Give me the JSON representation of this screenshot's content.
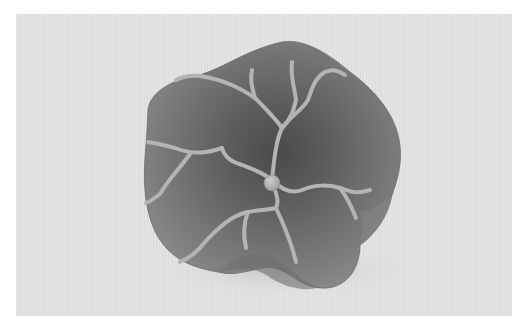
{
  "image": {
    "subject": "clay flower with raised veins",
    "alt": "Grayscale photograph of a sculpted clay flower with raised vein lines and a round center bead on a light textured background",
    "colors": {
      "border": "#ffffff",
      "background": "#e4e4e4",
      "petal_light": "#8a8a8a",
      "petal_dark": "#4a4a4a",
      "vein": "#b4b4b4",
      "center": "#b8b8b8"
    }
  }
}
